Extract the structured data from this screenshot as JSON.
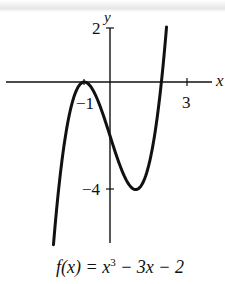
{
  "chart_data": {
    "type": "line",
    "title": "",
    "function": "f(x) = x^3 - 3x - 2",
    "xlabel": "x",
    "ylabel": "y",
    "xlim": [
      -4.2,
      4.3
    ],
    "ylim": [
      -6.0,
      2.0
    ],
    "x_tick_labels": [
      "-1",
      "3"
    ],
    "y_tick_labels": [
      "2",
      "-4"
    ],
    "grid": false,
    "series": [
      {
        "name": "f(x) = x^3 - 3x - 2",
        "x": [
          -2.2,
          -2.0,
          -1.5,
          -1.0,
          -0.5,
          0.0,
          0.5,
          1.0,
          1.5,
          2.0,
          2.2
        ],
        "y": [
          -6.05,
          -4.0,
          -0.88,
          0.0,
          -0.63,
          -2.0,
          -3.38,
          -4.0,
          -3.13,
          0.0,
          2.05
        ]
      }
    ],
    "annotations": [
      "local max at (-1, 0)",
      "local min at (1, -4)"
    ]
  },
  "labels": {
    "x_axis": "x",
    "y_axis": "y",
    "tick_neg1": "−1",
    "tick_3": "3",
    "tick_2": "2",
    "tick_neg4": "−4",
    "caption_prefix": "f(x) = x",
    "caption_exp": "3",
    "caption_suffix": " − 3x − 2"
  }
}
